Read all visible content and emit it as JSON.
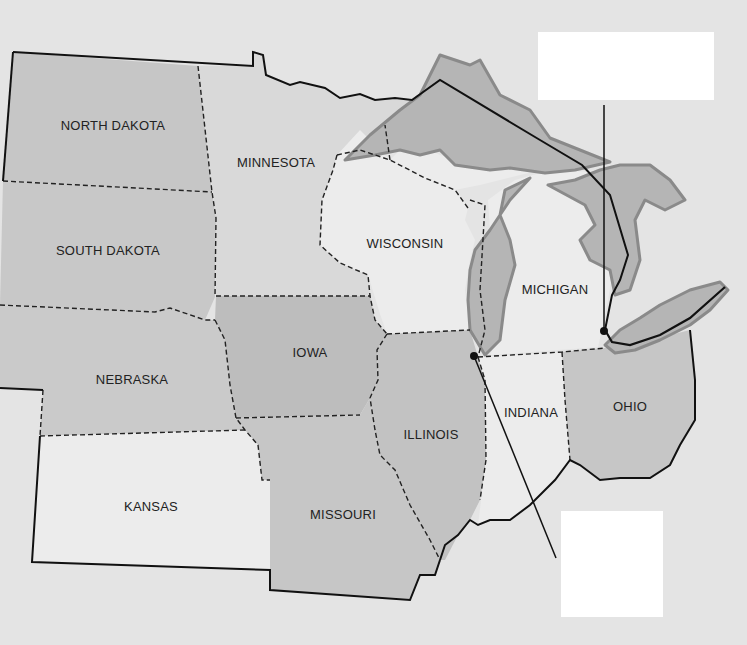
{
  "map": {
    "title": "Midwest United States",
    "states": [
      {
        "name": "NORTH DAKOTA",
        "x": 113,
        "y": 125
      },
      {
        "name": "MINNESOTA",
        "x": 276,
        "y": 162
      },
      {
        "name": "SOUTH DAKOTA",
        "x": 108,
        "y": 250
      },
      {
        "name": "WISCONSIN",
        "x": 405,
        "y": 243
      },
      {
        "name": "MICHIGAN",
        "x": 555,
        "y": 289
      },
      {
        "name": "IOWA",
        "x": 310,
        "y": 352
      },
      {
        "name": "NEBRASKA",
        "x": 132,
        "y": 379
      },
      {
        "name": "INDIANA",
        "x": 531,
        "y": 412
      },
      {
        "name": "OHIO",
        "x": 630,
        "y": 406
      },
      {
        "name": "ILLINOIS",
        "x": 431,
        "y": 434
      },
      {
        "name": "KANSAS",
        "x": 151,
        "y": 506
      },
      {
        "name": "MISSOURI",
        "x": 343,
        "y": 514
      }
    ],
    "label_boxes": [
      {
        "id": "box-top",
        "x": 538,
        "y": 32,
        "w": 176,
        "h": 68,
        "text": ""
      },
      {
        "id": "box-bottom",
        "x": 561,
        "y": 511,
        "w": 102,
        "h": 106,
        "text": ""
      }
    ],
    "markers": [
      {
        "id": "marker-chicago",
        "x": 474,
        "y": 356
      },
      {
        "id": "marker-detroit",
        "x": 604,
        "y": 331
      }
    ],
    "colors": {
      "background": "#e4e4e4",
      "dark_state": "#bdbdbd",
      "mid_state": "#cbcbcb",
      "light_state": "#e9e9e9",
      "lake_fill": "#b5b5b5",
      "lake_stroke": "#8a8a8a",
      "border": "#111111",
      "box": "#ffffff"
    }
  }
}
